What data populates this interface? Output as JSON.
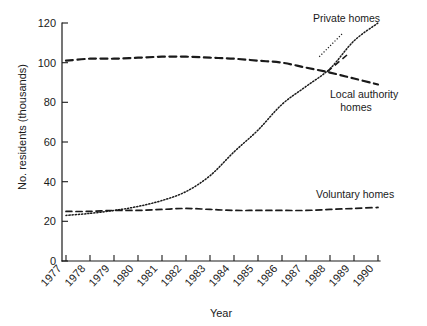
{
  "chart_data": {
    "type": "line",
    "title": "",
    "xlabel": "Year",
    "ylabel": "No. residents (thousands)",
    "xlim": [
      1977,
      1990
    ],
    "ylim": [
      0,
      120
    ],
    "grid": false,
    "legend_position": "inline-annotations",
    "x": [
      1977,
      1978,
      1979,
      1980,
      1981,
      1982,
      1983,
      1984,
      1985,
      1986,
      1987,
      1988,
      1989,
      1990
    ],
    "ytick_labels": [
      "0",
      "20",
      "40",
      "60",
      "80",
      "100",
      "120"
    ],
    "ytick_values": [
      0,
      20,
      40,
      60,
      80,
      100,
      120
    ],
    "xtick_labels": [
      "1977",
      "1978",
      "1979",
      "1980",
      "1981",
      "1982",
      "1983",
      "1984",
      "1985",
      "1986",
      "1987",
      "1988",
      "1989",
      "1990"
    ],
    "series": [
      {
        "name": "Local authority homes",
        "style": "dashed-thick",
        "values": [
          101,
          102,
          102,
          102.5,
          103,
          103,
          102.5,
          102,
          101,
          100,
          97.5,
          95,
          92,
          89
        ]
      },
      {
        "name": "Private homes",
        "style": "dotted",
        "values": [
          23,
          24,
          25.5,
          27.5,
          30.5,
          35,
          43,
          55,
          66,
          79,
          88,
          97,
          111,
          120
        ]
      },
      {
        "name": "Voluntary homes",
        "style": "dashed-thin",
        "values": [
          25,
          25,
          25.5,
          25.5,
          26,
          26.5,
          26,
          25.5,
          25.5,
          25.5,
          25.5,
          26,
          26.5,
          27
        ]
      }
    ],
    "annotations": [
      {
        "text": "Private homes",
        "series": "Private homes"
      },
      {
        "text_line_1": "Local authority",
        "text_line_2": "homes",
        "series": "Local authority homes"
      },
      {
        "text": "Voluntary homes",
        "series": "Voluntary homes"
      }
    ]
  },
  "axes": {
    "y_title": "No. residents (thousands)",
    "x_title": "Year",
    "y_ticks": [
      "120",
      "100",
      "80",
      "60",
      "40",
      "20",
      "0"
    ],
    "x_ticks": [
      "1977",
      "1978",
      "1979",
      "1980",
      "1981",
      "1982",
      "1983",
      "1984",
      "1985",
      "1986",
      "1987",
      "1988",
      "1989",
      "1990"
    ]
  },
  "labels": {
    "private_homes": "Private homes",
    "local_authority_line1": "Local authority",
    "local_authority_line2": "homes",
    "voluntary_homes": "Voluntary homes"
  },
  "colors": {
    "ink": "#1a1a1a",
    "background": "#ffffff"
  }
}
